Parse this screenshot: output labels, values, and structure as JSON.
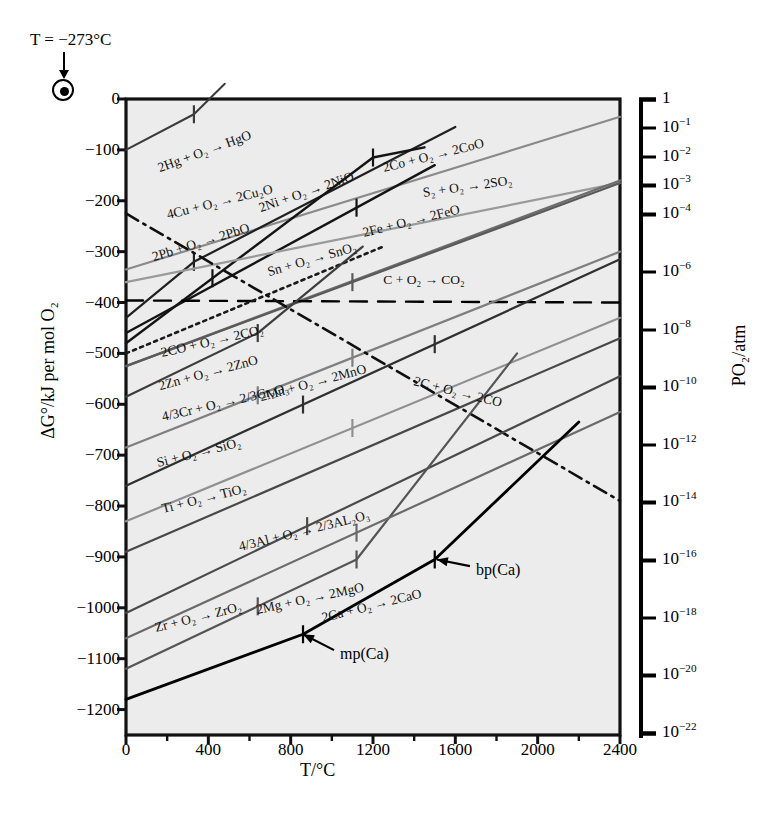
{
  "figure": {
    "type": "ellingham-diagram",
    "annotation_left": "T = −273°C",
    "annotation_marker": "bullseye-origin-marker"
  },
  "axes": {
    "x": {
      "label": "T/°C",
      "ticks": [
        0,
        400,
        800,
        1200,
        1600,
        2000,
        2400
      ],
      "tick_labels": [
        "0",
        "400",
        "800",
        "1200",
        "1600",
        "2000",
        "2400"
      ],
      "minor_step": 200,
      "range": [
        0,
        2400
      ]
    },
    "y": {
      "label": "ΔG°/kJ per mol O₂",
      "ticks": [
        0,
        -100,
        -200,
        -300,
        -400,
        -500,
        -600,
        -700,
        -800,
        -900,
        -1000,
        -1100,
        -1200
      ],
      "tick_labels": [
        "0",
        "−100",
        "−200",
        "−300",
        "−400",
        "−500",
        "−600",
        "−700",
        "−800",
        "−900",
        "−1000",
        "−1100",
        "−1200"
      ],
      "range": [
        -1250,
        0
      ]
    },
    "right": {
      "label": "PO₂/atm",
      "exponents": [
        0,
        -1,
        -2,
        -3,
        -4,
        -6,
        -8,
        -10,
        -12,
        -14,
        -16,
        -18,
        -20,
        -22
      ],
      "tick_labels": [
        "1",
        "10⁻¹",
        "10⁻²",
        "10⁻³",
        "10⁻⁴",
        "10⁻⁶",
        "10⁻⁸",
        "10⁻¹⁰",
        "10⁻¹²",
        "10⁻¹⁴",
        "10⁻¹⁶",
        "10⁻¹⁸",
        "10⁻²⁰",
        "10⁻²²"
      ]
    }
  },
  "callouts": [
    {
      "id": "mp-ca",
      "text": "mp(Ca)",
      "x": 1040,
      "y": -1095,
      "arrow_to_x": 860,
      "arrow_to_y": -1052
    },
    {
      "id": "bp-ca",
      "text": "bp(Ca)",
      "x": 1700,
      "y": -930,
      "arrow_to_x": 1510,
      "arrow_to_y": -905
    }
  ],
  "chart_data": {
    "type": "line",
    "xlabel": "T/°C",
    "ylabel": "ΔG°/kJ per mol O₂",
    "xlim": [
      0,
      2400
    ],
    "ylim": [
      -1250,
      0
    ],
    "grid": false,
    "legend": "inline-labels",
    "reference_line": {
      "name": "zero-carbon-reference",
      "y": -400,
      "style": "dashed",
      "color": "#000000"
    },
    "series": [
      {
        "name": "2Hg + O₂ → 2HgO",
        "label": "2Hg + O₂ → HgO",
        "color": "#3a3a3a",
        "width": 2.0,
        "style": "solid",
        "points": [
          [
            0,
            -100
          ],
          [
            330,
            -30
          ],
          [
            480,
            30
          ]
        ],
        "transitions": [
          {
            "T": 330,
            "kind": "bp"
          }
        ],
        "label_pos": {
          "x": 170,
          "y": -135,
          "angle": -20
        }
      },
      {
        "name": "4Cu + O₂ → 2Cu₂O",
        "label": "4Cu + O₂ → 2Cu₂O",
        "color": "#8a8a8a",
        "width": 2.2,
        "style": "solid",
        "points": [
          [
            0,
            -335
          ],
          [
            2400,
            -35
          ]
        ],
        "transitions": [],
        "label_pos": {
          "x": 210,
          "y": -228,
          "angle": -14
        }
      },
      {
        "name": "2Pb + O₂ → 2PbO",
        "label": "2Pb + O₂ → 2PbO",
        "color": "#202020",
        "width": 2.2,
        "style": "solid",
        "points": [
          [
            0,
            -430
          ],
          [
            330,
            -320
          ],
          [
            1600,
            -55
          ]
        ],
        "transitions": [
          {
            "T": 330,
            "kind": "mp"
          }
        ],
        "label_pos": {
          "x": 140,
          "y": -310,
          "angle": -17
        }
      },
      {
        "name": "2Ni + O₂ → 2NiO",
        "label": "2Ni + O₂ → 2NiO",
        "color": "#141414",
        "width": 2.4,
        "style": "solid",
        "points": [
          [
            0,
            -480
          ],
          [
            1200,
            -115
          ],
          [
            1450,
            -95
          ]
        ],
        "transitions": [
          {
            "T": 420,
            "kind": "mp"
          },
          {
            "T": 1200,
            "kind": "bp"
          }
        ],
        "label_pos": {
          "x": 660,
          "y": -215,
          "angle": -19
        }
      },
      {
        "name": "2Co + O₂ → 2CoO",
        "label": "2Co + O₂ → 2CoO",
        "color": "#141414",
        "width": 2.4,
        "style": "solid",
        "points": [
          [
            0,
            -460
          ],
          [
            1500,
            -130
          ]
        ],
        "transitions": [
          {
            "T": 1120,
            "kind": "mp"
          }
        ],
        "label_pos": {
          "x": 1260,
          "y": -135,
          "angle": -14
        }
      },
      {
        "name": "S₂ + O₂ → 2SO₂",
        "label": "S₂ + O₂ → 2SO₂",
        "color": "#9a9a9a",
        "width": 2.2,
        "style": "solid",
        "points": [
          [
            0,
            -360
          ],
          [
            2400,
            -165
          ]
        ],
        "transitions": [],
        "label_pos": {
          "x": 1450,
          "y": -185,
          "angle": -8
        }
      },
      {
        "name": "Sn + O₂ → SnO₂",
        "label": "Sn + O₂ → SnO₂",
        "color": "#6d6d6d",
        "width": 2.2,
        "style": "solid",
        "points": [
          [
            0,
            -525
          ],
          [
            2400,
            -160
          ]
        ],
        "transitions": [],
        "label_pos": {
          "x": 700,
          "y": -340,
          "angle": -16
        }
      },
      {
        "name": "2Fe + O₂ → 2FeO",
        "label": "2Fe + O₂ → 2FeO",
        "color": "#5a5a5a",
        "width": 2.2,
        "style": "solid",
        "points": [
          [
            0,
            -525
          ],
          [
            2400,
            -165
          ]
        ],
        "transitions": [
          {
            "T": 1100,
            "kind": "mp"
          }
        ],
        "label_pos": {
          "x": 1160,
          "y": -263,
          "angle": -14
        }
      },
      {
        "name": "C + O₂ → CO₂",
        "label": "C + O₂ → CO₂",
        "color": "#000000",
        "width": 2.4,
        "style": "dashed",
        "points": [
          [
            0,
            -396
          ],
          [
            2400,
            -400
          ]
        ],
        "transitions": [],
        "label_pos": {
          "x": 1250,
          "y": -355,
          "angle": 0
        }
      },
      {
        "name": "2CO + O₂ → 2CO₂",
        "label": "2CO + O₂ → 2CO₂",
        "color": "#1a1a1a",
        "width": 2.6,
        "style": "dotted",
        "points": [
          [
            0,
            -500
          ],
          [
            1250,
            -290
          ]
        ],
        "transitions": [],
        "label_pos": {
          "x": 180,
          "y": -500,
          "angle": -13
        }
      },
      {
        "name": "2Zn + O₂ → 2ZnO",
        "label": "2Zn + O₂ → 2ZnO",
        "color": "#3d3d3d",
        "width": 2.2,
        "style": "solid",
        "points": [
          [
            0,
            -585
          ],
          [
            640,
            -460
          ],
          [
            1150,
            -290
          ]
        ],
        "transitions": [
          {
            "T": 640,
            "kind": "bp"
          }
        ],
        "label_pos": {
          "x": 170,
          "y": -565,
          "angle": -15
        }
      },
      {
        "name": "4/3Cr + O₂ → 2/3Cr₂O₃",
        "label": "4/3Cr + O₂ → 2/3Cr₂O₃",
        "color": "#7f7f7f",
        "width": 2.2,
        "style": "solid",
        "points": [
          [
            0,
            -685
          ],
          [
            2400,
            -300
          ]
        ],
        "transitions": [
          {
            "T": 640,
            "kind": "mp"
          },
          {
            "T": 1100,
            "kind": "mp"
          }
        ],
        "label_pos": {
          "x": 185,
          "y": -625,
          "angle": -13
        }
      },
      {
        "name": "2Mn + O₂ → 2MnO",
        "label": "2Mn + O₂ → 2MnO",
        "color": "#303030",
        "width": 2.3,
        "style": "solid",
        "points": [
          [
            0,
            -760
          ],
          [
            2400,
            -315
          ]
        ],
        "transitions": [
          {
            "T": 860,
            "kind": "mp"
          },
          {
            "T": 1500,
            "kind": "bp"
          }
        ],
        "label_pos": {
          "x": 660,
          "y": -585,
          "angle": -15
        }
      },
      {
        "name": "Si + O₂ → SiO₂",
        "label": "Si + O₂ → SiO₂",
        "color": "#909090",
        "width": 2.2,
        "style": "solid",
        "points": [
          [
            0,
            -830
          ],
          [
            2400,
            -430
          ]
        ],
        "transitions": [
          {
            "T": 1100,
            "kind": "mp"
          }
        ],
        "label_pos": {
          "x": 160,
          "y": -715,
          "angle": -14
        }
      },
      {
        "name": "Ti + O₂ → TiO₂",
        "label": "Ti + O₂ → TiO₂",
        "color": "#484848",
        "width": 2.2,
        "style": "solid",
        "points": [
          [
            0,
            -890
          ],
          [
            2400,
            -470
          ]
        ],
        "transitions": [],
        "label_pos": {
          "x": 185,
          "y": -805,
          "angle": -14
        }
      },
      {
        "name": "2C + O₂ → 2CO",
        "label": "2C + O₂ → 2CO",
        "color": "#101010",
        "width": 2.6,
        "style": "dashdot",
        "points": [
          [
            0,
            -225
          ],
          [
            2400,
            -790
          ]
        ],
        "transitions": [],
        "label_pos": {
          "x": 1390,
          "y": -555,
          "angle": 14
        }
      },
      {
        "name": "4/3Al + O₂ → 2/3Al₂O₃",
        "label": "4/3Al + O₂ → 2/3AL₂O₃",
        "color": "#4a4a4a",
        "width": 2.2,
        "style": "solid",
        "points": [
          [
            0,
            -1010
          ],
          [
            2400,
            -545
          ]
        ],
        "transitions": [
          {
            "T": 880,
            "kind": "mp"
          }
        ],
        "label_pos": {
          "x": 560,
          "y": -880,
          "angle": -14
        }
      },
      {
        "name": "2Mg + O₂ → 2MgO",
        "label": "2Mg + O₂ → 2MgO",
        "color": "#555555",
        "width": 2.2,
        "style": "solid",
        "points": [
          [
            0,
            -1120
          ],
          [
            1120,
            -905
          ],
          [
            1900,
            -500
          ]
        ],
        "transitions": [
          {
            "T": 640,
            "kind": "mp"
          },
          {
            "T": 1120,
            "kind": "bp"
          }
        ],
        "label_pos": {
          "x": 640,
          "y": -1005,
          "angle": -12
        }
      },
      {
        "name": "Zr + O₂ → ZrO₂",
        "label": "Zr + O₂ → ZrO₂",
        "color": "#6a6a6a",
        "width": 2.2,
        "style": "solid",
        "points": [
          [
            0,
            -1060
          ],
          [
            2400,
            -615
          ]
        ],
        "transitions": [
          {
            "T": 1120,
            "kind": "mp"
          }
        ],
        "label_pos": {
          "x": 150,
          "y": -1040,
          "angle": -14
        }
      },
      {
        "name": "2Ca + O₂ → 2CaO",
        "label": "2Ca + O₂ → 2CaO",
        "color": "#000000",
        "width": 2.8,
        "style": "solid",
        "points": [
          [
            0,
            -1180
          ],
          [
            860,
            -1052
          ],
          [
            1500,
            -905
          ],
          [
            2200,
            -635
          ]
        ],
        "transitions": [
          {
            "T": 860,
            "kind": "mp"
          },
          {
            "T": 1500,
            "kind": "bp"
          }
        ],
        "label_pos": {
          "x": 960,
          "y": -1020,
          "angle": -14
        }
      }
    ]
  }
}
